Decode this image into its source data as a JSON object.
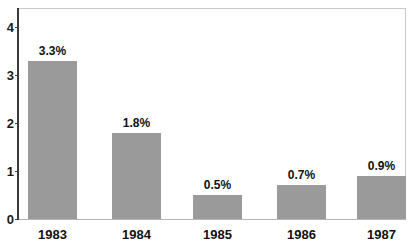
{
  "chart_data": {
    "type": "bar",
    "title": "",
    "subtitle": "",
    "xlabel": "",
    "ylabel": "",
    "categories": [
      "1983",
      "1984",
      "1985",
      "1986",
      "1987"
    ],
    "values": [
      3.3,
      1.8,
      0.5,
      0.7,
      0.9
    ],
    "data_labels": [
      "3.3%",
      "1.8%",
      "0.5%",
      "0.7%",
      "0.9%"
    ],
    "ylim": [
      0,
      4.4
    ],
    "yticks": [
      0,
      1,
      2,
      3,
      4
    ],
    "ytick_labels": [
      "0",
      "1",
      "2",
      "3",
      "4"
    ],
    "grid": false,
    "legend": null,
    "series": [
      {
        "name": "",
        "values": [
          3.3,
          1.8,
          0.5,
          0.7,
          0.9
        ]
      }
    ],
    "colors": {
      "bar": "#9a9a9a",
      "axis": "#3a3a3a",
      "frame": "#c9c9c9",
      "text": "#111111",
      "background": "#ffffff"
    }
  }
}
